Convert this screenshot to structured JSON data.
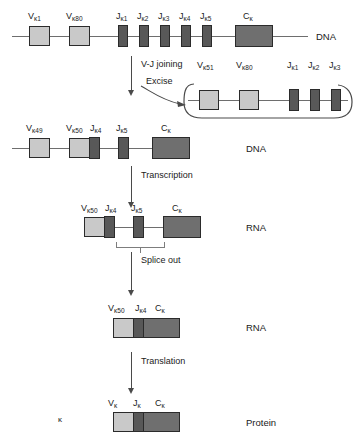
{
  "rows": [
    {
      "id": "germline-dna",
      "side_label": "DNA",
      "segments": [
        {
          "name": "V-kappa-1",
          "label_main": "V",
          "label_sub": "κ1",
          "type": "v"
        },
        {
          "name": "V-kappa-80",
          "label_main": "V",
          "label_sub": "κ80",
          "type": "v"
        },
        {
          "name": "J-kappa-1",
          "label_main": "J",
          "label_sub": "κ1",
          "type": "j"
        },
        {
          "name": "J-kappa-2",
          "label_main": "J",
          "label_sub": "κ2",
          "type": "j"
        },
        {
          "name": "J-kappa-3",
          "label_main": "J",
          "label_sub": "κ3",
          "type": "j"
        },
        {
          "name": "J-kappa-4",
          "label_main": "J",
          "label_sub": "κ4",
          "type": "j"
        },
        {
          "name": "J-kappa-5",
          "label_main": "J",
          "label_sub": "κ5",
          "type": "j"
        },
        {
          "name": "C-kappa",
          "label_main": "C",
          "label_sub": "κ",
          "type": "c"
        }
      ]
    },
    {
      "id": "rearranged-dna",
      "side_label": "DNA",
      "segments": [
        {
          "name": "V-kappa-49",
          "label_main": "V",
          "label_sub": "κ49",
          "type": "v"
        },
        {
          "name": "V-kappa-50",
          "label_main": "V",
          "label_sub": "κ50",
          "type": "v"
        },
        {
          "name": "J-kappa-4",
          "label_main": "J",
          "label_sub": "κ4",
          "type": "j"
        },
        {
          "name": "J-kappa-5",
          "label_main": "J",
          "label_sub": "κ5",
          "type": "j"
        },
        {
          "name": "C-kappa",
          "label_main": "C",
          "label_sub": "κ",
          "type": "c"
        }
      ]
    },
    {
      "id": "primary-rna",
      "side_label": "RNA",
      "segments": [
        {
          "name": "V-kappa-50",
          "label_main": "V",
          "label_sub": "κ50",
          "type": "v"
        },
        {
          "name": "J-kappa-4",
          "label_main": "J",
          "label_sub": "κ4",
          "type": "j"
        },
        {
          "name": "J-kappa-5",
          "label_main": "J",
          "label_sub": "κ5",
          "type": "j"
        },
        {
          "name": "C-kappa",
          "label_main": "C",
          "label_sub": "κ",
          "type": "c"
        }
      ]
    },
    {
      "id": "spliced-rna",
      "side_label": "RNA",
      "segments": [
        {
          "name": "V-kappa-50",
          "label_main": "V",
          "label_sub": "κ50",
          "type": "v"
        },
        {
          "name": "J-kappa-4",
          "label_main": "J",
          "label_sub": "κ4",
          "type": "j"
        },
        {
          "name": "C-kappa",
          "label_main": "C",
          "label_sub": "κ",
          "type": "c"
        }
      ]
    },
    {
      "id": "protein",
      "side_label": "Protein",
      "chain_label": "κ",
      "segments": [
        {
          "name": "V-kappa",
          "label_main": "V",
          "label_sub": "κ",
          "type": "v"
        },
        {
          "name": "J-kappa",
          "label_main": "J",
          "label_sub": "κ",
          "type": "j"
        },
        {
          "name": "C-kappa",
          "label_main": "C",
          "label_sub": "κ",
          "type": "c"
        }
      ]
    }
  ],
  "excised_circle": {
    "id": "excised-dna-circle",
    "segments": [
      {
        "name": "V-kappa-51",
        "label_main": "V",
        "label_sub": "κ51",
        "type": "v"
      },
      {
        "name": "V-kappa-80",
        "label_main": "V",
        "label_sub": "κ80",
        "type": "v"
      },
      {
        "name": "J-kappa-1",
        "label_main": "J",
        "label_sub": "κ1",
        "type": "j"
      },
      {
        "name": "J-kappa-2",
        "label_main": "J",
        "label_sub": "κ2",
        "type": "j"
      },
      {
        "name": "J-kappa-3",
        "label_main": "J",
        "label_sub": "κ3",
        "type": "j"
      }
    ]
  },
  "steps": {
    "vj_joining": "V-J joining",
    "excise": "Excise",
    "transcription": "Transcription",
    "splice_out": "Splice out",
    "translation": "Translation"
  },
  "colors": {
    "v_segment": "#c9c9c9",
    "j_segment": "#585858",
    "c_segment": "#6f6f6f",
    "outline": "#2b2b2b",
    "line": "#6e6e6e",
    "arrow": "#4a4a4a",
    "background": "#ffffff"
  }
}
